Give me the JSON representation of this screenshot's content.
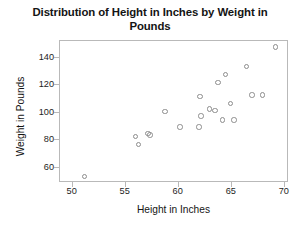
{
  "chart_data": {
    "type": "scatter",
    "title": "Distribution of Height in Inches by Weight in Pounds",
    "title_line1": "Distribution of Height in Inches by Weight in",
    "title_line2": "Pounds",
    "xlabel": "Height in Inches",
    "ylabel": "Weight in Pounds",
    "xlim": [
      48.8,
      70.4
    ],
    "ylim": [
      49.0,
      152.0
    ],
    "xticks": [
      50,
      55,
      60,
      65,
      70
    ],
    "yticks": [
      60,
      80,
      100,
      120,
      140
    ],
    "grid": false,
    "legend": null,
    "marker": "open-circle",
    "marker_color": "#8d8d8d",
    "series": [
      {
        "name": "observations",
        "x": [
          51.2,
          56.0,
          56.3,
          57.2,
          57.4,
          58.8,
          60.2,
          62.0,
          62.1,
          62.2,
          63.0,
          63.5,
          63.8,
          64.2,
          64.5,
          65.0,
          65.3,
          66.5,
          67.0,
          68.0,
          69.2
        ],
        "y": [
          53,
          82,
          76,
          84,
          83,
          100,
          89,
          89,
          111,
          97,
          102,
          101,
          121,
          94,
          127,
          106,
          94,
          133,
          112,
          112,
          147
        ]
      }
    ],
    "points": [
      {
        "height": 51.2,
        "weight": 53
      },
      {
        "height": 56.0,
        "weight": 82
      },
      {
        "height": 56.3,
        "weight": 76
      },
      {
        "height": 57.2,
        "weight": 84
      },
      {
        "height": 57.4,
        "weight": 83
      },
      {
        "height": 58.8,
        "weight": 100
      },
      {
        "height": 60.2,
        "weight": 89
      },
      {
        "height": 62.0,
        "weight": 89
      },
      {
        "height": 62.1,
        "weight": 111
      },
      {
        "height": 62.2,
        "weight": 97
      },
      {
        "height": 63.0,
        "weight": 102
      },
      {
        "height": 63.5,
        "weight": 101
      },
      {
        "height": 63.8,
        "weight": 121
      },
      {
        "height": 64.2,
        "weight": 94
      },
      {
        "height": 64.5,
        "weight": 127
      },
      {
        "height": 65.0,
        "weight": 106
      },
      {
        "height": 65.3,
        "weight": 94
      },
      {
        "height": 66.5,
        "weight": 133
      },
      {
        "height": 67.0,
        "weight": 112
      },
      {
        "height": 68.0,
        "weight": 112
      },
      {
        "height": 69.2,
        "weight": 147
      }
    ]
  }
}
